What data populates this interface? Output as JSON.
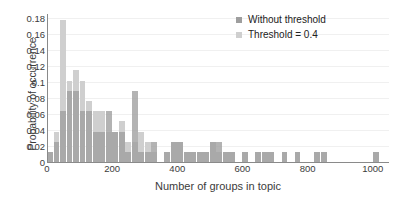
{
  "chart_data": {
    "type": "bar",
    "title": "",
    "xlabel": "Number of groups in topic",
    "ylabel": "Probability of occurrence",
    "xlim": [
      0,
      1050
    ],
    "ylim": [
      0,
      0.185
    ],
    "grid": true,
    "legend_position": "top-right",
    "x_ticks": [
      0,
      200,
      400,
      600,
      800,
      1000
    ],
    "y_ticks": [
      0,
      0.02,
      0.04,
      0.06,
      0.08,
      0.1,
      0.12,
      0.14,
      0.16,
      0.18
    ],
    "y_tick_labels": [
      "0",
      "0.02",
      "0.04",
      "0.06",
      "0.08",
      "0.1",
      "0.12",
      "0.14",
      "0.16",
      "0.18"
    ],
    "x_tick_labels": [
      "0",
      "200",
      "400",
      "600",
      "800",
      "1000"
    ],
    "bin_width": 20,
    "series": [
      {
        "name": "Without threshold",
        "color": "#9e9e9e",
        "bins": [
          10,
          30,
          50,
          70,
          90,
          110,
          130,
          150,
          170,
          190,
          210,
          230,
          250,
          270,
          290,
          310,
          330,
          370,
          390,
          410,
          430,
          450,
          470,
          490,
          510,
          530,
          550,
          570,
          610,
          650,
          670,
          690,
          730,
          770,
          830,
          850,
          1010
        ],
        "values": [
          0.0127,
          0.0253,
          0.0633,
          0.0887,
          0.0887,
          0.0633,
          0.0633,
          0.038,
          0.038,
          0.0633,
          0.038,
          0.038,
          0.0127,
          0.0887,
          0.0127,
          0.0127,
          0.0253,
          0.0127,
          0.0253,
          0.0253,
          0.0127,
          0.0127,
          0.0127,
          0.0127,
          0.0253,
          0.0253,
          0.0127,
          0.0127,
          0.0127,
          0.0127,
          0.0127,
          0.0127,
          0.0127,
          0.0127,
          0.0127,
          0.0127,
          0.0127
        ]
      },
      {
        "name": "Threshold = 0.4",
        "color": "#cfcfcf",
        "bins": [
          10,
          30,
          50,
          70,
          90,
          110,
          130,
          150,
          170,
          190,
          210,
          230,
          250,
          270,
          290,
          310,
          330,
          370,
          390,
          410,
          430,
          450,
          470,
          490,
          510,
          530,
          550,
          570,
          610,
          650,
          670,
          690,
          730,
          770,
          830,
          850,
          1010
        ],
        "values": [
          0.0127,
          0.038,
          0.1772,
          0.101,
          0.1152,
          0.101,
          0.0759,
          0.0633,
          0.0633,
          0.038,
          0.038,
          0.051,
          0.0253,
          0.0253,
          0.038,
          0.0253,
          0.0127,
          0.0127,
          0.0253,
          0.0253,
          0.0127,
          0.0127,
          0.0127,
          0.0127,
          0.0253,
          0.0127,
          0.0127,
          0.0127,
          0.0127,
          0.0127,
          0.0127,
          0.0127,
          0.0127,
          0.0127,
          0.0127,
          0.0127,
          0.0127
        ]
      }
    ]
  },
  "legend": {
    "items": [
      {
        "label": "Without threshold",
        "color": "#9e9e9e"
      },
      {
        "label": "Threshold = 0.4",
        "color": "#cfcfcf"
      }
    ]
  }
}
